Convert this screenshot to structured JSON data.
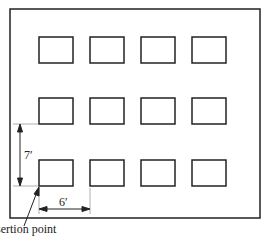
{
  "diagram": {
    "outer_border": {
      "x": 10,
      "y": 9,
      "w": 250,
      "h": 209
    },
    "grid": {
      "rows": 3,
      "cols": 4
    },
    "box": {
      "w": 34,
      "h": 26
    },
    "col_x": [
      39,
      90,
      141,
      192
    ],
    "row_y": [
      37,
      98,
      160
    ],
    "labels": {
      "vertical_spacing": "7′",
      "horizontal_spacing": "6′",
      "insertion_point": "Insertion point"
    },
    "colors": {
      "line": "#222222",
      "guide": "#999999",
      "background": "#ffffff"
    }
  }
}
